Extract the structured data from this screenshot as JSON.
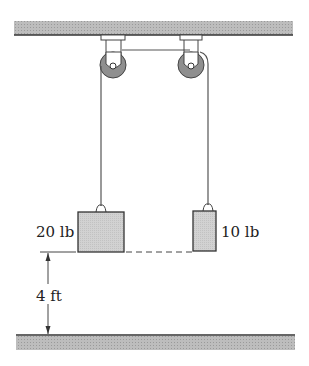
{
  "diagram": {
    "type": "pulley-system",
    "blocks": [
      {
        "id": "left",
        "label": "20 lb"
      },
      {
        "id": "right",
        "label": "10 lb"
      }
    ],
    "dimension": {
      "label": "4 ft"
    },
    "colors": {
      "support": "#b8b8b8",
      "block_fill": "#cfcfcf",
      "pulley_fill": "#8a8a8a",
      "line": "#333333"
    }
  }
}
